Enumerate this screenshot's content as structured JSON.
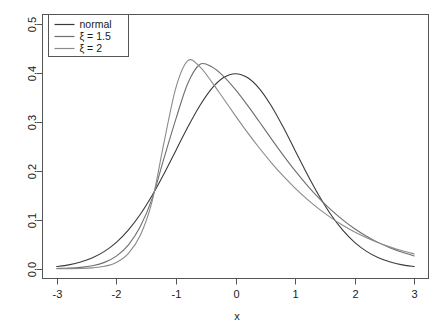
{
  "chart_data": {
    "type": "line",
    "title": "",
    "subtitle": "",
    "xlabel": "x",
    "ylabel": "",
    "xlim": [
      -3,
      3
    ],
    "ylim": [
      0,
      0.5
    ],
    "grid": false,
    "legend_position": "top-left",
    "x_ticks": [
      -3,
      -2,
      -1,
      0,
      1,
      2,
      3
    ],
    "x_tick_labels": [
      "-3",
      "-2",
      "-1",
      "0",
      "1",
      "2",
      "3"
    ],
    "y_ticks": [
      0.0,
      0.1,
      0.2,
      0.3,
      0.4,
      0.5
    ],
    "y_tick_labels": [
      "0.0",
      "0.1",
      "0.2",
      "0.3",
      "0.4",
      "0.5"
    ],
    "series": [
      {
        "name": "normal",
        "color": "#3a3a3a",
        "peak_x": 0.0,
        "peak_y": 0.399,
        "x": [
          -3.0,
          -2.8,
          -2.6,
          -2.4,
          -2.2,
          -2.0,
          -1.8,
          -1.6,
          -1.4,
          -1.2,
          -1.0,
          -0.8,
          -0.6,
          -0.4,
          -0.2,
          0.0,
          0.2,
          0.4,
          0.6,
          0.8,
          1.0,
          1.2,
          1.4,
          1.6,
          1.8,
          2.0,
          2.2,
          2.4,
          2.6,
          2.8,
          3.0
        ],
        "values": [
          0.0044,
          0.0079,
          0.0136,
          0.0224,
          0.0355,
          0.054,
          0.079,
          0.1109,
          0.1497,
          0.1942,
          0.242,
          0.2897,
          0.3332,
          0.3683,
          0.391,
          0.3989,
          0.391,
          0.3683,
          0.3332,
          0.2897,
          0.242,
          0.1942,
          0.1497,
          0.1109,
          0.079,
          0.054,
          0.0355,
          0.0224,
          0.0136,
          0.0079,
          0.0044
        ]
      },
      {
        "name": "ξ = 1.5",
        "color": "#6e6e6e",
        "peak_x": -0.62,
        "peak_y": 0.419,
        "x": [
          -3.0,
          -2.8,
          -2.6,
          -2.4,
          -2.2,
          -2.0,
          -1.8,
          -1.6,
          -1.4,
          -1.2,
          -1.0,
          -0.8,
          -0.6,
          -0.4,
          -0.2,
          0.0,
          0.2,
          0.4,
          0.6,
          0.8,
          1.0,
          1.2,
          1.4,
          1.6,
          1.8,
          2.0,
          2.2,
          2.4,
          2.6,
          2.8,
          3.0
        ],
        "values": [
          0.0005,
          0.0012,
          0.0028,
          0.0062,
          0.013,
          0.0258,
          0.0484,
          0.0857,
          0.1433,
          0.2263,
          0.3065,
          0.3793,
          0.4178,
          0.413,
          0.3936,
          0.3664,
          0.3346,
          0.3006,
          0.2661,
          0.2324,
          0.2005,
          0.1711,
          0.1444,
          0.1207,
          0.0999,
          0.0819,
          0.0665,
          0.0534,
          0.0425,
          0.0335,
          0.0262
        ]
      },
      {
        "name": "ξ = 2",
        "color": "#8a8a8a",
        "peak_x": -0.9,
        "peak_y": 0.43,
        "x": [
          -3.0,
          -2.8,
          -2.6,
          -2.4,
          -2.2,
          -2.0,
          -1.8,
          -1.6,
          -1.4,
          -1.2,
          -1.0,
          -0.8,
          -0.6,
          -0.4,
          -0.2,
          0.0,
          0.2,
          0.4,
          0.6,
          0.8,
          1.0,
          1.2,
          1.4,
          1.6,
          1.8,
          2.0,
          2.2,
          2.4,
          2.6,
          2.8,
          3.0
        ],
        "values": [
          5e-05,
          0.0002,
          0.0006,
          0.0018,
          0.005,
          0.0129,
          0.0308,
          0.0678,
          0.1378,
          0.2584,
          0.3705,
          0.4255,
          0.4135,
          0.3823,
          0.3476,
          0.3127,
          0.2789,
          0.2469,
          0.2171,
          0.1897,
          0.1648,
          0.1424,
          0.1223,
          0.1046,
          0.089,
          0.0753,
          0.0634,
          0.0531,
          0.0442,
          0.0366,
          0.0302
        ]
      }
    ],
    "legend_entries": [
      {
        "label": "normal",
        "color": "#3a3a3a"
      },
      {
        "label": "ξ = 1.5",
        "color": "#6e6e6e"
      },
      {
        "label": "ξ = 2",
        "color": "#8a8a8a"
      }
    ],
    "annotations": []
  },
  "axes": {
    "x_label": "x",
    "y_label": ""
  }
}
